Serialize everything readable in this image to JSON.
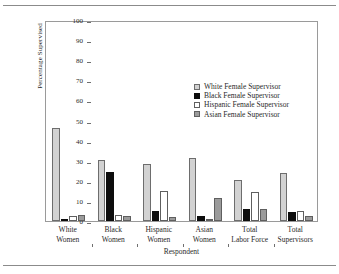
{
  "chart_data": {
    "type": "bar",
    "title": "",
    "xlabel": "Respondent",
    "ylabel": "Percentage Supervised",
    "ylim": [
      0,
      100
    ],
    "ytick_step": 10,
    "yticks": [
      0,
      10,
      20,
      30,
      40,
      50,
      60,
      70,
      80,
      90,
      100
    ],
    "ytick_labels": [
      "0",
      "10",
      "20",
      "30",
      "40",
      "50",
      "60",
      "70",
      "80",
      "90",
      "100"
    ],
    "grid": false,
    "legend_position": "upper center-right inside axes",
    "categories": [
      "White Women",
      "Black Women",
      "Hispanic Women",
      "Asian Women",
      "Total Labor Force",
      "Total Supervisors"
    ],
    "category_lines": [
      [
        "White",
        "Women"
      ],
      [
        "Black",
        "Women"
      ],
      [
        "Hispanic",
        "Women"
      ],
      [
        "Asian",
        "Women"
      ],
      [
        "Total",
        "Labor Force"
      ],
      [
        "Total",
        "Supervisors"
      ]
    ],
    "series": [
      {
        "name": "White Female Supervisor",
        "color": "#d2d2d2",
        "values": [
          46.5,
          30.5,
          28.5,
          31.5,
          20.5,
          24.0
        ]
      },
      {
        "name": "Black Female Supervisor",
        "color": "#0d0d0d",
        "values": [
          0.8,
          24.5,
          5.0,
          2.5,
          5.8,
          4.5
        ]
      },
      {
        "name": "Hispanic Female Supervisor",
        "color": "#ffffff",
        "values": [
          2.5,
          3.0,
          15.0,
          1.0,
          14.5,
          5.0
        ]
      },
      {
        "name": "Asian Female Supervisor",
        "color": "#9b9b9b",
        "values": [
          3.0,
          2.5,
          2.0,
          11.5,
          5.8,
          2.5
        ]
      }
    ]
  },
  "legend": {
    "entries": [
      "White Female Supervisor",
      "Black Female Supervisor",
      "Hispanic Female Supervisor",
      "Asian Female Supervisor"
    ]
  }
}
